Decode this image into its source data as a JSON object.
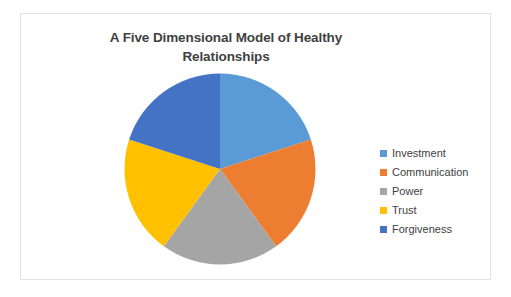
{
  "chart_data": {
    "type": "pie",
    "title": "A Five Dimensional Model of Healthy Relationships",
    "title_line1": "A Five Dimensional Model of Healthy",
    "title_line2": "Relationships",
    "categories": [
      "Investment",
      "Communication",
      "Power",
      "Trust",
      "Forgiveness"
    ],
    "values": [
      20,
      20,
      20,
      20,
      20
    ],
    "value_unit": "%",
    "colors": [
      "#5B9BD5",
      "#ED7D31",
      "#A5A5A5",
      "#FFC000",
      "#4472C4"
    ],
    "start_angle_deg": 0,
    "direction": "clockwise",
    "legend_position": "right",
    "grid": false,
    "data_labels_visible": false,
    "slices": [
      {
        "label": "Investment",
        "value": 20,
        "color": "#5B9BD5"
      },
      {
        "label": "Communication",
        "value": 20,
        "color": "#ED7D31"
      },
      {
        "label": "Power",
        "value": 20,
        "color": "#A5A5A5"
      },
      {
        "label": "Trust",
        "value": 20,
        "color": "#FFC000"
      },
      {
        "label": "Forgiveness",
        "value": 20,
        "color": "#4472C4"
      }
    ]
  },
  "frame": {
    "border_color": "#e2e2e2",
    "background": "#ffffff"
  },
  "legend": {
    "entries": [
      {
        "label": "Investment",
        "color": "#5B9BD5"
      },
      {
        "label": "Communication",
        "color": "#ED7D31"
      },
      {
        "label": "Power",
        "color": "#A5A5A5"
      },
      {
        "label": "Trust",
        "color": "#FFC000"
      },
      {
        "label": "Forgiveness",
        "color": "#4472C4"
      }
    ]
  }
}
